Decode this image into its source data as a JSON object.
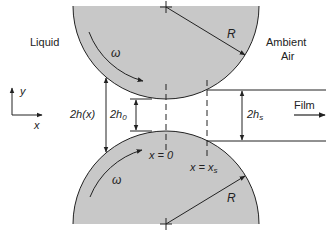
{
  "diagram": {
    "colors": {
      "roller_fill": "#c8c8c8",
      "stroke": "#222222",
      "background": "#ffffff"
    },
    "regions": {
      "left": "Liquid",
      "right_line1": "Ambient",
      "right_line2": "Air"
    },
    "rollers": [
      {
        "name": "top-roller",
        "radius_label": "R",
        "rotation_label": "ω",
        "rotation": "clockwise"
      },
      {
        "name": "bottom-roller",
        "radius_label": "R",
        "rotation_label": "ω",
        "rotation": "counter-clockwise"
      }
    ],
    "axes": {
      "x": "x",
      "y": "y"
    },
    "dimensions": {
      "gap_at_x": "2h(x)",
      "min_gap_prefix": "2h",
      "min_gap_sub": "0",
      "film_gap_prefix": "2h",
      "film_gap_sub": "s"
    },
    "positions": {
      "center_line": "x = 0",
      "separation_prefix": "x = x",
      "separation_sub": "s"
    },
    "film_label": "Film"
  }
}
